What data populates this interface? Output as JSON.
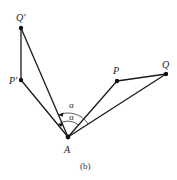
{
  "figure": {
    "caption": "(b)",
    "points": {
      "Q_prime": {
        "label": "Q'",
        "x": 21,
        "y": 28
      },
      "P_prime": {
        "label": "P'",
        "x": 21,
        "y": 80
      },
      "A": {
        "label": "A",
        "x": 68,
        "y": 137
      },
      "P": {
        "label": "P",
        "x": 117,
        "y": 81
      },
      "Q": {
        "label": "Q",
        "x": 166,
        "y": 74
      }
    },
    "segments": [
      [
        "Q_prime",
        "P_prime"
      ],
      [
        "P_prime",
        "A"
      ],
      [
        "Q_prime",
        "A"
      ],
      [
        "A",
        "P"
      ],
      [
        "P",
        "Q"
      ],
      [
        "A",
        "Q"
      ]
    ],
    "angles": [
      {
        "label": "α",
        "description": "angle between AQ' and AQ (outer arc)"
      },
      {
        "label": "α",
        "description": "angle between AP' and AP (inner arc)"
      }
    ],
    "colors": {
      "stroke": "#1a1a1a",
      "background": "#ffffff"
    }
  }
}
